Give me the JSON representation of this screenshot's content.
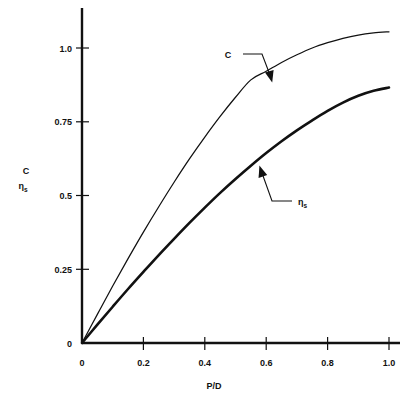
{
  "chart_data": {
    "type": "line",
    "title": "",
    "subtitle": "",
    "xlabel": "P/D",
    "ylabel_line1": "C",
    "ylabel_line2_base": "η",
    "ylabel_line2_sub": "s",
    "xlim": [
      0,
      1.04
    ],
    "ylim": [
      0,
      1.12
    ],
    "grid": false,
    "legend_position": "inline-annotations",
    "x_ticks": [
      0,
      0.2,
      0.4,
      0.6,
      0.8,
      1.0
    ],
    "x_tick_labels": [
      "0",
      "0.2",
      "0.4",
      "0.6",
      "0.8",
      "1.0"
    ],
    "y_ticks": [
      0,
      0.25,
      0.5,
      0.75,
      1.0
    ],
    "y_tick_labels": [
      "0",
      "0.25",
      "0.5",
      "0.75",
      "1.0"
    ],
    "x": [
      0,
      0.05,
      0.1,
      0.15,
      0.2,
      0.25,
      0.3,
      0.35,
      0.4,
      0.45,
      0.5,
      0.55,
      0.6,
      0.65,
      0.7,
      0.75,
      0.8,
      0.85,
      0.9,
      0.95,
      1.0
    ],
    "series": [
      {
        "name": "C",
        "label": "C",
        "style": "thin",
        "values": [
          0.0,
          0.097,
          0.193,
          0.286,
          0.376,
          0.462,
          0.545,
          0.624,
          0.698,
          0.768,
          0.833,
          0.892,
          0.921,
          0.951,
          0.977,
          1.0,
          1.018,
          1.033,
          1.044,
          1.051,
          1.055
        ]
      },
      {
        "name": "eta_s",
        "label": "η",
        "label_sub": "s",
        "style": "thick",
        "values": [
          0.0,
          0.062,
          0.123,
          0.183,
          0.241,
          0.298,
          0.353,
          0.407,
          0.459,
          0.509,
          0.556,
          0.601,
          0.644,
          0.684,
          0.721,
          0.755,
          0.787,
          0.815,
          0.838,
          0.855,
          0.866
        ]
      }
    ],
    "annotations": [
      {
        "name": "c-curve-annotation",
        "text": "C",
        "target_x": 0.56,
        "target_y": 0.885
      },
      {
        "name": "eta-s-curve-annotation",
        "text": "η",
        "text_sub": "s",
        "target_x": 0.53,
        "target_y": 0.585
      }
    ],
    "colors": {
      "ink": "#111111",
      "background": "#ffffff"
    }
  }
}
